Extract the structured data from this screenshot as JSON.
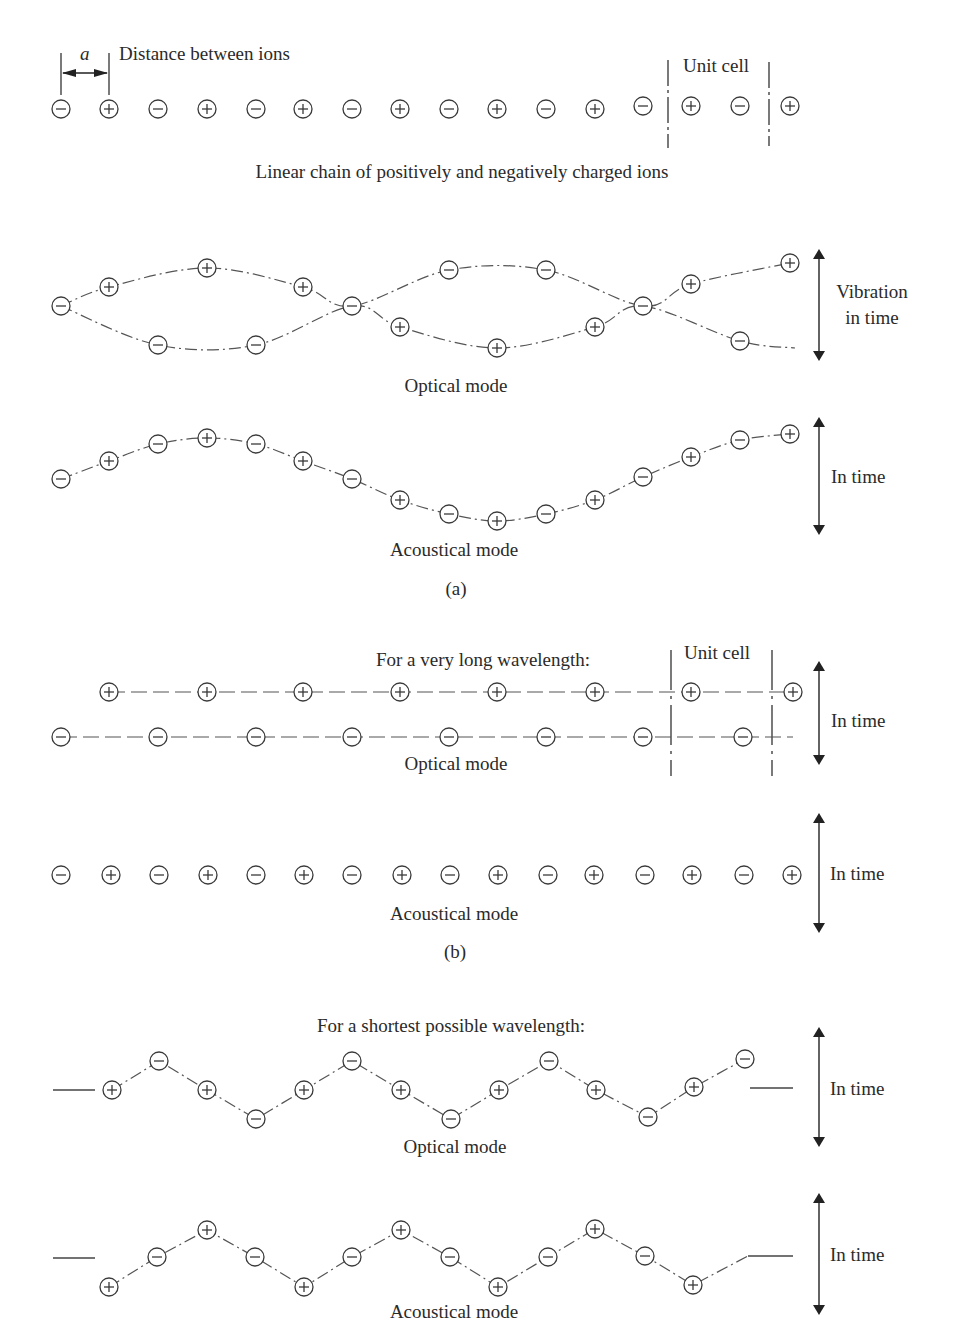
{
  "figure": {
    "ion_radius": 9,
    "colors": {
      "ink": "#2a2a2a",
      "line": "#555555",
      "background": "#ffffff"
    },
    "top": {
      "a_label": "a",
      "distance_label": "Distance between ions",
      "unit_cell_label": "Unit cell",
      "caption": "Linear chain of positively and negatively charged ions",
      "ions": [
        {
          "x": 61,
          "y": 109,
          "c": "-"
        },
        {
          "x": 109,
          "y": 109,
          "c": "+"
        },
        {
          "x": 158,
          "y": 109,
          "c": "-"
        },
        {
          "x": 207,
          "y": 109,
          "c": "+"
        },
        {
          "x": 256,
          "y": 109,
          "c": "-"
        },
        {
          "x": 303,
          "y": 109,
          "c": "+"
        },
        {
          "x": 352,
          "y": 109,
          "c": "-"
        },
        {
          "x": 400,
          "y": 109,
          "c": "+"
        },
        {
          "x": 449,
          "y": 109,
          "c": "-"
        },
        {
          "x": 497,
          "y": 109,
          "c": "+"
        },
        {
          "x": 546,
          "y": 109,
          "c": "-"
        },
        {
          "x": 595,
          "y": 109,
          "c": "+"
        },
        {
          "x": 643,
          "y": 106,
          "c": "-"
        },
        {
          "x": 691,
          "y": 106,
          "c": "+"
        },
        {
          "x": 740,
          "y": 106,
          "c": "-"
        },
        {
          "x": 790,
          "y": 106,
          "c": "+"
        }
      ]
    },
    "panel_a": {
      "label": "(a)",
      "optical": {
        "label": "Optical mode",
        "side_label_line1": "Vibration",
        "side_label_line2": "in time",
        "upper_curve": [
          [
            61,
            306
          ],
          [
            109,
            287
          ],
          [
            207,
            268
          ],
          [
            303,
            287
          ],
          [
            352,
            306
          ],
          [
            449,
            270
          ],
          [
            546,
            270
          ],
          [
            643,
            306
          ],
          [
            691,
            284
          ],
          [
            790,
            263
          ]
        ],
        "lower_curve": [
          [
            61,
            306
          ],
          [
            158,
            345
          ],
          [
            256,
            345
          ],
          [
            352,
            306
          ],
          [
            400,
            327
          ],
          [
            497,
            348
          ],
          [
            595,
            327
          ],
          [
            643,
            306
          ],
          [
            740,
            341
          ],
          [
            795,
            348
          ]
        ],
        "ions": [
          {
            "x": 61,
            "y": 306,
            "c": "-"
          },
          {
            "x": 109,
            "y": 287,
            "c": "+"
          },
          {
            "x": 207,
            "y": 268,
            "c": "+"
          },
          {
            "x": 303,
            "y": 287,
            "c": "+"
          },
          {
            "x": 158,
            "y": 345,
            "c": "-"
          },
          {
            "x": 256,
            "y": 345,
            "c": "-"
          },
          {
            "x": 352,
            "y": 306,
            "c": "-"
          },
          {
            "x": 400,
            "y": 327,
            "c": "+"
          },
          {
            "x": 497,
            "y": 348,
            "c": "+"
          },
          {
            "x": 595,
            "y": 327,
            "c": "+"
          },
          {
            "x": 449,
            "y": 270,
            "c": "-"
          },
          {
            "x": 546,
            "y": 270,
            "c": "-"
          },
          {
            "x": 643,
            "y": 306,
            "c": "-"
          },
          {
            "x": 691,
            "y": 284,
            "c": "+"
          },
          {
            "x": 790,
            "y": 263,
            "c": "+"
          },
          {
            "x": 740,
            "y": 341,
            "c": "-"
          }
        ]
      },
      "acoustical": {
        "label": "Acoustical mode",
        "side_label": "In time",
        "ions": [
          {
            "x": 61,
            "y": 479,
            "c": "-"
          },
          {
            "x": 109,
            "y": 461,
            "c": "+"
          },
          {
            "x": 158,
            "y": 444,
            "c": "-"
          },
          {
            "x": 207,
            "y": 438,
            "c": "+"
          },
          {
            "x": 256,
            "y": 444,
            "c": "-"
          },
          {
            "x": 303,
            "y": 461,
            "c": "+"
          },
          {
            "x": 352,
            "y": 479,
            "c": "-"
          },
          {
            "x": 400,
            "y": 500,
            "c": "+"
          },
          {
            "x": 449,
            "y": 514,
            "c": "-"
          },
          {
            "x": 497,
            "y": 521,
            "c": "+"
          },
          {
            "x": 546,
            "y": 514,
            "c": "-"
          },
          {
            "x": 595,
            "y": 500,
            "c": "+"
          },
          {
            "x": 643,
            "y": 477,
            "c": "-"
          },
          {
            "x": 691,
            "y": 457,
            "c": "+"
          },
          {
            "x": 740,
            "y": 440,
            "c": "-"
          },
          {
            "x": 790,
            "y": 434,
            "c": "+"
          }
        ]
      }
    },
    "panel_b": {
      "label": "(b)",
      "heading": "For a very long wavelength:",
      "unit_cell_label": "Unit cell",
      "optical": {
        "label": "Optical mode",
        "side_label": "In time",
        "plus_row": {
          "y": 692,
          "xs": [
            109,
            207,
            303,
            400,
            497,
            595,
            691,
            793
          ]
        },
        "minus_row": {
          "y": 737,
          "xs": [
            61,
            158,
            256,
            352,
            449,
            546,
            643,
            743
          ]
        }
      },
      "acoustical": {
        "label": "Acoustical mode",
        "side_label": "In time",
        "ions": [
          {
            "x": 61,
            "y": 875,
            "c": "-"
          },
          {
            "x": 111,
            "y": 875,
            "c": "+"
          },
          {
            "x": 159,
            "y": 875,
            "c": "-"
          },
          {
            "x": 208,
            "y": 875,
            "c": "+"
          },
          {
            "x": 256,
            "y": 875,
            "c": "-"
          },
          {
            "x": 304,
            "y": 875,
            "c": "+"
          },
          {
            "x": 352,
            "y": 875,
            "c": "-"
          },
          {
            "x": 402,
            "y": 875,
            "c": "+"
          },
          {
            "x": 450,
            "y": 875,
            "c": "-"
          },
          {
            "x": 498,
            "y": 875,
            "c": "+"
          },
          {
            "x": 548,
            "y": 875,
            "c": "-"
          },
          {
            "x": 594,
            "y": 875,
            "c": "+"
          },
          {
            "x": 645,
            "y": 875,
            "c": "-"
          },
          {
            "x": 692,
            "y": 875,
            "c": "+"
          },
          {
            "x": 744,
            "y": 875,
            "c": "-"
          },
          {
            "x": 792,
            "y": 875,
            "c": "+"
          }
        ]
      }
    },
    "panel_c": {
      "heading": "For a shortest possible wavelength:",
      "optical": {
        "label": "Optical mode",
        "side_label": "In time",
        "ions": [
          {
            "x": 112,
            "y": 1090,
            "c": "+"
          },
          {
            "x": 159,
            "y": 1061,
            "c": "-"
          },
          {
            "x": 207,
            "y": 1090,
            "c": "+"
          },
          {
            "x": 256,
            "y": 1119,
            "c": "-"
          },
          {
            "x": 304,
            "y": 1090,
            "c": "+"
          },
          {
            "x": 352,
            "y": 1061,
            "c": "-"
          },
          {
            "x": 401,
            "y": 1090,
            "c": "+"
          },
          {
            "x": 451,
            "y": 1119,
            "c": "-"
          },
          {
            "x": 499,
            "y": 1090,
            "c": "+"
          },
          {
            "x": 549,
            "y": 1061,
            "c": "-"
          },
          {
            "x": 596,
            "y": 1090,
            "c": "+"
          },
          {
            "x": 648,
            "y": 1117,
            "c": "-"
          },
          {
            "x": 694,
            "y": 1087,
            "c": "+"
          },
          {
            "x": 745,
            "y": 1059,
            "c": "-"
          }
        ],
        "lead_in": [
          [
            53,
            1090
          ],
          [
            95,
            1090
          ]
        ],
        "lead_out": [
          [
            750,
            1088
          ],
          [
            793,
            1088
          ]
        ]
      },
      "acoustical": {
        "label": "Acoustical mode",
        "side_label": "In time",
        "ions": [
          {
            "x": 109,
            "y": 1287,
            "c": "+"
          },
          {
            "x": 157,
            "y": 1257,
            "c": "-"
          },
          {
            "x": 207,
            "y": 1230,
            "c": "+"
          },
          {
            "x": 255,
            "y": 1257,
            "c": "-"
          },
          {
            "x": 304,
            "y": 1287,
            "c": "+"
          },
          {
            "x": 352,
            "y": 1257,
            "c": "-"
          },
          {
            "x": 401,
            "y": 1230,
            "c": "+"
          },
          {
            "x": 450,
            "y": 1257,
            "c": "-"
          },
          {
            "x": 498,
            "y": 1287,
            "c": "+"
          },
          {
            "x": 548,
            "y": 1257,
            "c": "-"
          },
          {
            "x": 595,
            "y": 1229,
            "c": "+"
          },
          {
            "x": 645,
            "y": 1256,
            "c": "-"
          },
          {
            "x": 693,
            "y": 1285,
            "c": "+"
          }
        ],
        "lead_in": [
          [
            53,
            1258
          ],
          [
            95,
            1258
          ]
        ],
        "lead_out_curve": [
          [
            703,
            1283
          ],
          [
            748,
            1256
          ]
        ],
        "lead_out": [
          [
            748,
            1256
          ],
          [
            793,
            1256
          ]
        ]
      }
    }
  }
}
